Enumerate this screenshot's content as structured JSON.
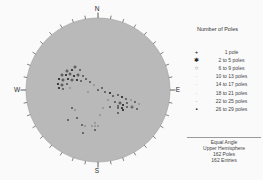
{
  "colors": {
    "circle_fill": "#b9b9b9",
    "circle_stroke": "#9c9c9c",
    "tick": "#4a4a4a",
    "label_text": "#2b2b2b",
    "point_dark": "#212121",
    "point_mid": "#4f4f4f",
    "point_light": "#8c8c8c"
  },
  "chart_data": {
    "type": "scatter",
    "plot_kind": "stereonet-pole-plot",
    "cardinal_labels": {
      "north": "N",
      "east": "E",
      "south": "S",
      "west": "W"
    },
    "tick_interval_deg": 10,
    "circle": {
      "cx": 98,
      "cy": 90,
      "r": 72
    },
    "points": [
      [
        75,
        67,
        "p",
        "k"
      ],
      [
        67,
        71,
        "p",
        "k"
      ],
      [
        72,
        70,
        "d",
        "k"
      ],
      [
        80,
        70,
        "d",
        "m"
      ],
      [
        62,
        75,
        "p",
        "k"
      ],
      [
        66,
        75,
        "d",
        "k"
      ],
      [
        70,
        74,
        "p",
        "k"
      ],
      [
        74,
        76,
        "d",
        "k"
      ],
      [
        78,
        75,
        "p",
        "k"
      ],
      [
        83,
        76,
        "d",
        "m"
      ],
      [
        59,
        79,
        "d",
        "k"
      ],
      [
        63,
        80,
        "p",
        "k"
      ],
      [
        68,
        79,
        "d",
        "k"
      ],
      [
        72,
        80,
        "p",
        "k"
      ],
      [
        77,
        80,
        "d",
        "k"
      ],
      [
        81,
        81,
        "d",
        "m"
      ],
      [
        86,
        79,
        "d",
        "m"
      ],
      [
        58,
        84,
        "d",
        "k"
      ],
      [
        62,
        85,
        "p",
        "k"
      ],
      [
        67,
        84,
        "d",
        "m"
      ],
      [
        59,
        88,
        "d",
        "k"
      ],
      [
        63,
        89,
        "d",
        "m"
      ],
      [
        70,
        88,
        "d",
        "l"
      ],
      [
        90,
        82,
        "d",
        "m"
      ],
      [
        94,
        85,
        "d",
        "l"
      ],
      [
        98,
        90,
        "d",
        "m"
      ],
      [
        102,
        88,
        "d",
        "m"
      ],
      [
        88,
        92,
        "d",
        "l"
      ],
      [
        105,
        92,
        "d",
        "m"
      ],
      [
        110,
        93,
        "d",
        "k"
      ],
      [
        113,
        96,
        "d",
        "m"
      ],
      [
        108,
        100,
        "d",
        "l"
      ],
      [
        118,
        95,
        "d",
        "m"
      ],
      [
        122,
        97,
        "d",
        "k"
      ],
      [
        126,
        99,
        "d",
        "m"
      ],
      [
        115,
        102,
        "d",
        "m"
      ],
      [
        120,
        103,
        "p",
        "k"
      ],
      [
        123,
        105,
        "d",
        "k"
      ],
      [
        127,
        103,
        "d",
        "m"
      ],
      [
        131,
        100,
        "d",
        "l"
      ],
      [
        135,
        102,
        "d",
        "m"
      ],
      [
        139,
        104,
        "d",
        "l"
      ],
      [
        132,
        107,
        "p",
        "k"
      ],
      [
        137,
        109,
        "d",
        "m"
      ],
      [
        118,
        108,
        "d",
        "m"
      ],
      [
        123,
        110,
        "d",
        "k"
      ],
      [
        103,
        108,
        "d",
        "l"
      ],
      [
        110,
        107,
        "d",
        "m"
      ],
      [
        118,
        106,
        "d",
        "m"
      ],
      [
        122,
        108,
        "d",
        "k"
      ],
      [
        127,
        107,
        "d",
        "m"
      ],
      [
        132,
        106,
        "d",
        "l"
      ],
      [
        118,
        113,
        "d",
        "m"
      ],
      [
        72,
        108,
        "d",
        "m"
      ],
      [
        75,
        110,
        "d",
        "l"
      ],
      [
        100,
        115,
        "d",
        "l"
      ],
      [
        77,
        118,
        "d",
        "m"
      ],
      [
        68,
        120,
        "d",
        "m"
      ],
      [
        95,
        123,
        "d",
        "l"
      ],
      [
        82,
        125,
        "d",
        "m"
      ],
      [
        85,
        126,
        "d",
        "l"
      ],
      [
        92,
        126,
        "d",
        "l"
      ],
      [
        95,
        126,
        "d",
        "l"
      ],
      [
        98,
        126,
        "d",
        "l"
      ],
      [
        95,
        130,
        "d",
        "m"
      ],
      [
        83,
        133,
        "d",
        "m"
      ]
    ],
    "legend": {
      "title": "Number of Poles",
      "items": [
        {
          "label": "1 pole",
          "symbol": "plus",
          "shade": "dark"
        },
        {
          "label": "2 to 5 poles",
          "symbol": "asterisk",
          "shade": "dark"
        },
        {
          "label": "6 to 9 poles",
          "symbol": "circle",
          "shade": "mid"
        },
        {
          "label": "10 to 13 poles",
          "symbol": "dot",
          "shade": "faint"
        },
        {
          "label": "14 to 17 poles",
          "symbol": "dot",
          "shade": "faint"
        },
        {
          "label": "18 to 21 poles",
          "symbol": "dot",
          "shade": "faint"
        },
        {
          "label": "22 to 25 poles",
          "symbol": "dot",
          "shade": "mid"
        },
        {
          "label": "26 to 29 poles",
          "symbol": "square",
          "shade": "dark"
        }
      ]
    },
    "footer_lines": [
      "Equal Angle",
      "Upper Hemisphere",
      "162 Poles",
      "162 Entries"
    ]
  }
}
